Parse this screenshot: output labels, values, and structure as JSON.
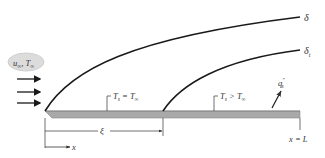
{
  "diagram": {
    "freestream": {
      "label_u": "u",
      "label_u_sub": "∞",
      "label_sep": ", ",
      "label_T": "T",
      "label_T_sub": "∞"
    },
    "boundary_layers": {
      "velocity": {
        "label": "δ"
      },
      "thermal": {
        "label": "δ",
        "label_sub": "t"
      }
    },
    "regions": {
      "unheated": {
        "label_T": "T",
        "label_sub": "s",
        "relation": " = ",
        "label_Tinf": "T",
        "label_inf_sub": "∞"
      },
      "heated": {
        "label_T": "T",
        "label_sub": "s",
        "relation": " > ",
        "label_Tinf": "T",
        "label_inf_sub": "∞"
      }
    },
    "heat_flux": {
      "label": "q",
      "label_sup": "″",
      "label_sub": "s"
    },
    "dimensions": {
      "xi": {
        "label": "ξ"
      },
      "end": {
        "label": "x = L"
      },
      "axis": {
        "label": "x"
      }
    },
    "colors": {
      "plate_fill": "#a9a9a9",
      "plate_edge": "#7f7f7f",
      "line": "#1a1a1a",
      "cloud": "#d9d9d9"
    }
  }
}
